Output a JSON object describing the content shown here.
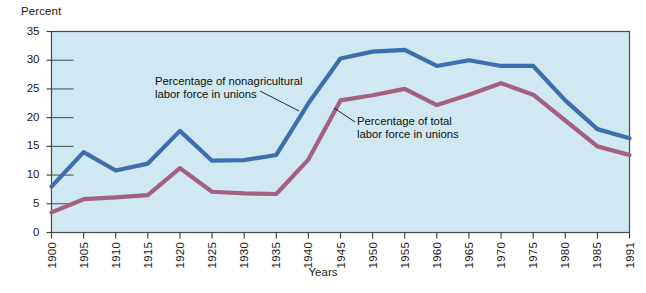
{
  "chart_data": {
    "type": "line",
    "title": "",
    "ylabel": "Percent",
    "xlabel": "Years",
    "ylim": [
      0,
      35
    ],
    "yticks": [
      0,
      5,
      10,
      15,
      20,
      25,
      30,
      35
    ],
    "grid": true,
    "legend_position": "inline-annotations",
    "plot_background": "#cfe8f2",
    "categories": [
      "1900",
      "1905",
      "1910",
      "1915",
      "1920",
      "1925",
      "1930",
      "1935",
      "1940",
      "1945",
      "1950",
      "1955",
      "1960",
      "1965",
      "1970",
      "1975",
      "1980",
      "1985",
      "1991"
    ],
    "series": [
      {
        "name": "Percentage of nonagricultural labor force in unions",
        "color": "#3d6fae",
        "values": [
          8.0,
          14.0,
          10.8,
          12.0,
          17.7,
          12.5,
          12.6,
          13.5,
          22.5,
          30.3,
          31.5,
          31.8,
          29.0,
          30.0,
          29.0,
          29.0,
          23.0,
          18.0,
          16.4
        ]
      },
      {
        "name": "Percentage of total labor force in unions",
        "color": "#a3617f",
        "values": [
          3.5,
          5.8,
          6.1,
          6.5,
          11.2,
          7.1,
          6.8,
          6.7,
          12.7,
          23.0,
          23.9,
          25.0,
          22.2,
          24.0,
          26.0,
          24.0,
          19.5,
          15.0,
          13.5
        ]
      }
    ],
    "annotations": [
      {
        "id": "annotation-nonagricultural",
        "text": "Percentage of nonagricultural\nlabor force in unions",
        "leader_from": [
          299,
          111
        ],
        "leader_to": [
          260,
          91
        ]
      },
      {
        "id": "annotation-total",
        "text": "Percentage of total\nlabor force in unions",
        "leader_from": [
          355,
          122
        ],
        "leader_to": [
          334,
          108
        ]
      }
    ]
  },
  "axis": {
    "y_title": "Percent",
    "x_title": "Years",
    "y_labels": [
      "35",
      "30",
      "25",
      "20",
      "15",
      "10",
      "5",
      "0"
    ],
    "x_labels": [
      "1900",
      "1905",
      "1910",
      "1915",
      "1920",
      "1925",
      "1930",
      "1935",
      "1940",
      "1945",
      "1950",
      "1955",
      "1960",
      "1965",
      "1970",
      "1975",
      "1980",
      "1985",
      "1991"
    ]
  },
  "annotations": {
    "nonagricultural": "Percentage of nonagricultural\nlabor force in unions",
    "total": "Percentage of total\nlabor force in unions"
  },
  "colors": {
    "series_nonagricultural": "#3d6fae",
    "series_total": "#a3617f",
    "plot_background": "#cfe8f2",
    "axis": "#3a3a3a"
  }
}
